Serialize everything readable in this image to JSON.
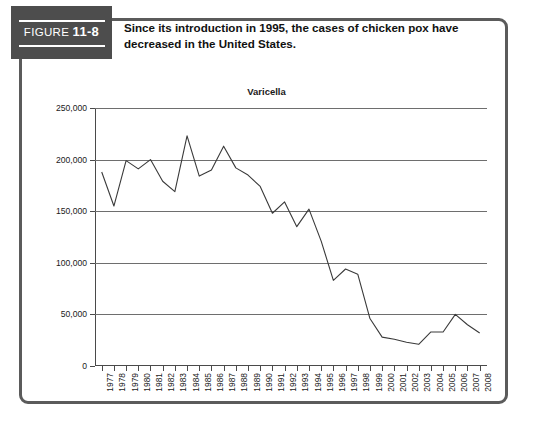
{
  "figure": {
    "label_word": "FIGURE",
    "label_number": "11-8",
    "caption": "Since its introduction in 1995, the cases of chicken pox have decreased in the United States.",
    "source_note": ""
  },
  "colors": {
    "badge_background": "#4d4d4d",
    "frame_border": "#5b5b5b",
    "line": "#3a3a3a",
    "gridline": "#6e6e6e",
    "text": "#111111"
  },
  "chart_data": {
    "type": "line",
    "title": "Varicella",
    "xlabel": "",
    "ylabel": "",
    "ylim": [
      0,
      250000
    ],
    "yticks": [
      0,
      50000,
      100000,
      150000,
      200000,
      250000
    ],
    "ytick_labels": [
      "0",
      "50,000",
      "100,000",
      "150,000",
      "200,000",
      "250,000"
    ],
    "grid": true,
    "legend": "none",
    "categories": [
      "1977",
      "1978",
      "1979",
      "1980",
      "1981",
      "1982",
      "1983",
      "1984",
      "1985",
      "1986",
      "1987",
      "1988",
      "1989",
      "1990",
      "1991",
      "1992",
      "1993",
      "1994",
      "1995",
      "1996",
      "1997",
      "1998",
      "1999",
      "2000",
      "2001",
      "2002",
      "2003",
      "2004",
      "2005",
      "2006",
      "2007",
      "2008"
    ],
    "values": [
      188000,
      155000,
      199000,
      191000,
      200000,
      179000,
      169000,
      223000,
      184000,
      190000,
      213000,
      192000,
      185000,
      174000,
      148000,
      159000,
      135000,
      152000,
      121000,
      83000,
      94000,
      89000,
      46000,
      28000,
      26000,
      23000,
      21000,
      33000,
      33000,
      50000,
      40000,
      32000
    ]
  }
}
